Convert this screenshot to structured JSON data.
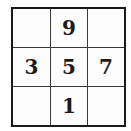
{
  "puzzle": {
    "type": "3x3 number grid",
    "cells": [
      [
        "",
        "9",
        ""
      ],
      [
        "3",
        "5",
        "7"
      ],
      [
        "",
        "1",
        ""
      ]
    ]
  },
  "colors": {
    "line": "#1a1a1a",
    "text": "#1c1c1c",
    "background": "#ffffff"
  }
}
